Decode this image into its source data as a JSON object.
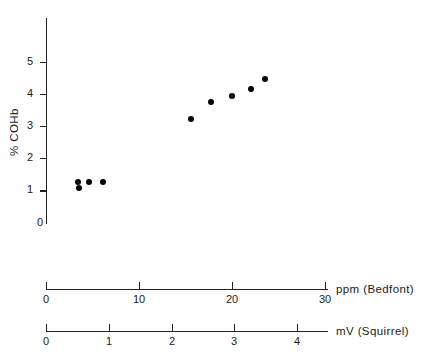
{
  "chart_data": {
    "type": "scatter",
    "title": "",
    "xlabel": "ppm (Bedfont)",
    "ylabel": "% COHb",
    "secondary_xlabel": "mV (Squirrel)",
    "xlim": [
      0,
      30
    ],
    "ylim": [
      0,
      5.4
    ],
    "secondary_xlim": [
      0,
      4.45
    ],
    "xticks": [
      "0",
      "10",
      "20",
      "30"
    ],
    "xtick_values": [
      0,
      10,
      20,
      30
    ],
    "yticks": [
      "0",
      "1",
      "2",
      "3",
      "4",
      "5"
    ],
    "ytick_values": [
      0,
      1,
      2,
      3,
      4,
      5
    ],
    "secondary_xticks": [
      "0",
      "1",
      "2",
      "3",
      "4"
    ],
    "secondary_xtick_values": [
      0,
      1,
      2,
      3,
      4
    ],
    "grid": false,
    "legend": "none",
    "marker": "filled-circle",
    "marker_color": "#000000",
    "points": [
      {
        "x": 3.4,
        "y": 1.28
      },
      {
        "x": 3.5,
        "y": 1.1
      },
      {
        "x": 4.5,
        "y": 1.27
      },
      {
        "x": 6.0,
        "y": 1.29
      },
      {
        "x": 15.5,
        "y": 3.22
      },
      {
        "x": 17.7,
        "y": 3.77
      },
      {
        "x": 19.9,
        "y": 3.96
      },
      {
        "x": 22.0,
        "y": 4.18
      },
      {
        "x": 23.5,
        "y": 4.47
      }
    ]
  },
  "axes": {
    "y": {
      "label": "% COHb"
    },
    "x_primary": {
      "label": "ppm (Bedfont)"
    },
    "x_secondary": {
      "label": "mV (Squirrel)"
    }
  }
}
